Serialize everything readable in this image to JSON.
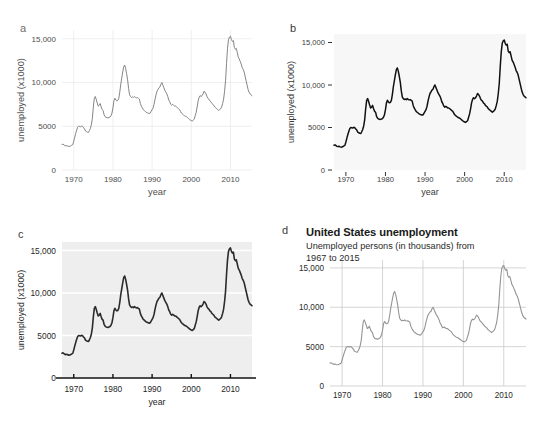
{
  "figure": {
    "panels": [
      {
        "letter": "a",
        "theme": "minimal-white",
        "xlabel": "year",
        "ylabel": "unemployed (x1000)",
        "title": "",
        "subtitle": "",
        "line_color": "#777777",
        "line_width": 0.9,
        "panel_bg": "#ffffff",
        "grid_color": "#ebebeb",
        "grid_x": true,
        "grid_y": true,
        "axis_line": false,
        "ticks": false,
        "tick_label_color": "#4d4d4d",
        "ytick_labels": [
          "0",
          "5000",
          "10,000",
          "15,000"
        ],
        "ytick_values": [
          0,
          5000,
          10000,
          15000
        ],
        "xtick_labels": [
          "1970",
          "1980",
          "1990",
          "2000",
          "2010"
        ],
        "xtick_values": [
          1970,
          1980,
          1990,
          2000,
          2010
        ]
      },
      {
        "letter": "b",
        "theme": "classic-ticks",
        "xlabel": "year",
        "ylabel": "unemployed (x1000)",
        "title": "",
        "subtitle": "",
        "line_color": "#111111",
        "line_width": 1.5,
        "panel_bg": "#f7f7f7",
        "grid_color": "none",
        "grid_x": false,
        "grid_y": false,
        "axis_line": false,
        "ticks": true,
        "tick_label_color": "#3a3a3a",
        "ytick_labels": [
          "0",
          "5000",
          "10,000",
          "15,000"
        ],
        "ytick_values": [
          0,
          5000,
          10000,
          15000
        ],
        "xtick_labels": [
          "1970",
          "1980",
          "1990",
          "2000",
          "2010"
        ],
        "xtick_values": [
          1970,
          1980,
          1990,
          2000,
          2010
        ]
      },
      {
        "letter": "c",
        "theme": "gray-white-grid",
        "xlabel": "year",
        "ylabel": "unemployed (x1000)",
        "title": "",
        "subtitle": "",
        "line_color": "#2b2b2b",
        "line_width": 1.6,
        "panel_bg": "#eeeeee",
        "grid_color": "#ffffff",
        "grid_x": false,
        "grid_y": true,
        "axis_line": true,
        "ticks": true,
        "tick_label_color": "#1f1f1f",
        "ytick_labels": [
          "0",
          "5000",
          "10,000",
          "15,000"
        ],
        "ytick_values": [
          0,
          5000,
          10000,
          15000
        ],
        "xtick_labels": [
          "1970",
          "1980",
          "1990",
          "2000",
          "2010"
        ],
        "xtick_values": [
          1970,
          1980,
          1990,
          2000,
          2010
        ]
      },
      {
        "letter": "d",
        "theme": "titled-white-grid",
        "xlabel": "",
        "ylabel": "",
        "title": "United States unemployment",
        "subtitle": "Unemployed persons (in thousands) from 1967 to 2015",
        "line_color": "#949494",
        "line_width": 1.1,
        "panel_bg": "#ffffff",
        "grid_color": "#c9c9c9",
        "grid_x": true,
        "grid_y": true,
        "axis_line": false,
        "ticks": false,
        "tick_label_color": "#2b2b2b",
        "ytick_labels": [
          "0",
          "5000",
          "10,000",
          "15,000"
        ],
        "ytick_values": [
          0,
          5000,
          10000,
          15000
        ],
        "xtick_labels": [
          "1970",
          "1980",
          "1990",
          "2000",
          "2010"
        ],
        "xtick_values": [
          1970,
          1980,
          1990,
          2000,
          2010
        ]
      }
    ]
  },
  "chart_data": {
    "type": "line",
    "title": "United States unemployment",
    "subtitle": "Unemployed persons (in thousands) from 1967 to 2015",
    "xlabel": "year",
    "ylabel": "unemployed (x1000)",
    "xlim": [
      1967.0,
      2015.5
    ],
    "ylim": [
      0,
      16000
    ],
    "grid": true,
    "legend": "none",
    "series": [
      {
        "name": "unemployed",
        "x": [
          1967.0,
          1967.25,
          1967.5,
          1967.75,
          1968.0,
          1968.25,
          1968.5,
          1968.75,
          1969.0,
          1969.25,
          1969.5,
          1969.75,
          1970.0,
          1970.25,
          1970.5,
          1970.75,
          1971.0,
          1971.25,
          1971.5,
          1971.75,
          1972.0,
          1972.25,
          1972.5,
          1972.75,
          1973.0,
          1973.25,
          1973.5,
          1973.75,
          1974.0,
          1974.25,
          1974.5,
          1974.75,
          1975.0,
          1975.25,
          1975.5,
          1975.75,
          1976.0,
          1976.25,
          1976.5,
          1976.75,
          1977.0,
          1977.25,
          1977.5,
          1977.75,
          1978.0,
          1978.25,
          1978.5,
          1978.75,
          1979.0,
          1979.25,
          1979.5,
          1979.75,
          1980.0,
          1980.25,
          1980.5,
          1980.75,
          1981.0,
          1981.25,
          1981.5,
          1981.75,
          1982.0,
          1982.25,
          1982.5,
          1982.75,
          1983.0,
          1983.25,
          1983.5,
          1983.75,
          1984.0,
          1984.25,
          1984.5,
          1984.75,
          1985.0,
          1985.25,
          1985.5,
          1985.75,
          1986.0,
          1986.25,
          1986.5,
          1986.75,
          1987.0,
          1987.25,
          1987.5,
          1987.75,
          1988.0,
          1988.25,
          1988.5,
          1988.75,
          1989.0,
          1989.25,
          1989.5,
          1989.75,
          1990.0,
          1990.25,
          1990.5,
          1990.75,
          1991.0,
          1991.25,
          1991.5,
          1991.75,
          1992.0,
          1992.25,
          1992.5,
          1992.75,
          1993.0,
          1993.25,
          1993.5,
          1993.75,
          1994.0,
          1994.25,
          1994.5,
          1994.75,
          1995.0,
          1995.25,
          1995.5,
          1995.75,
          1996.0,
          1996.25,
          1996.5,
          1996.75,
          1997.0,
          1997.25,
          1997.5,
          1997.75,
          1998.0,
          1998.25,
          1998.5,
          1998.75,
          1999.0,
          1999.25,
          1999.5,
          1999.75,
          2000.0,
          2000.25,
          2000.5,
          2000.75,
          2001.0,
          2001.25,
          2001.5,
          2001.75,
          2002.0,
          2002.25,
          2002.5,
          2002.75,
          2003.0,
          2003.25,
          2003.5,
          2003.75,
          2004.0,
          2004.25,
          2004.5,
          2004.75,
          2005.0,
          2005.25,
          2005.5,
          2005.75,
          2006.0,
          2006.25,
          2006.5,
          2006.75,
          2007.0,
          2007.25,
          2007.5,
          2007.75,
          2008.0,
          2008.25,
          2008.5,
          2008.75,
          2009.0,
          2009.25,
          2009.5,
          2009.75,
          2010.0,
          2010.25,
          2010.5,
          2010.75,
          2011.0,
          2011.25,
          2011.5,
          2011.75,
          2012.0,
          2012.25,
          2012.5,
          2012.75,
          2013.0,
          2013.25,
          2013.5,
          2013.75,
          2014.0,
          2014.25,
          2014.5,
          2014.75,
          2015.0,
          2015.25,
          2015.5
        ],
        "values": [
          2920,
          2960,
          2870,
          2780,
          2750,
          2800,
          2720,
          2690,
          2700,
          2760,
          2840,
          2900,
          3300,
          3750,
          4180,
          4560,
          4880,
          5000,
          4980,
          4940,
          5020,
          4980,
          4830,
          4700,
          4450,
          4380,
          4320,
          4290,
          4500,
          4760,
          5180,
          5900,
          7200,
          8200,
          8400,
          8050,
          7650,
          7300,
          7400,
          7600,
          7200,
          6900,
          6800,
          6300,
          6100,
          6000,
          5980,
          5950,
          6000,
          6050,
          6200,
          6500,
          7100,
          7900,
          8200,
          8000,
          7900,
          7950,
          8200,
          8900,
          9800,
          10500,
          11200,
          11800,
          12000,
          11600,
          11000,
          10300,
          9300,
          8600,
          8400,
          8300,
          8350,
          8280,
          8400,
          8300,
          8250,
          8280,
          8200,
          8100,
          7600,
          7300,
          7100,
          6900,
          6800,
          6700,
          6600,
          6550,
          6500,
          6450,
          6500,
          6700,
          6900,
          7100,
          7500,
          8100,
          8600,
          9000,
          9200,
          9400,
          9500,
          9800,
          10000,
          9700,
          9400,
          9100,
          8900,
          8700,
          8400,
          8000,
          7800,
          7500,
          7400,
          7500,
          7400,
          7300,
          7300,
          7200,
          7100,
          7000,
          6900,
          6700,
          6500,
          6400,
          6300,
          6200,
          6150,
          6100,
          6000,
          5900,
          5800,
          5700,
          5650,
          5600,
          5700,
          5800,
          6200,
          6600,
          7200,
          7900,
          8300,
          8500,
          8400,
          8500,
          8700,
          9000,
          8900,
          8700,
          8400,
          8200,
          8100,
          7900,
          7800,
          7600,
          7500,
          7400,
          7200,
          7100,
          7000,
          6900,
          6800,
          6900,
          7000,
          7200,
          7600,
          8100,
          9000,
          10200,
          12200,
          13900,
          14900,
          15200,
          15300,
          14900,
          14700,
          14800,
          14000,
          13800,
          13900,
          13400,
          12900,
          12700,
          12400,
          12100,
          11700,
          11500,
          11200,
          10700,
          10200,
          9700,
          9200,
          8900,
          8700,
          8600,
          8500
        ]
      }
    ]
  }
}
